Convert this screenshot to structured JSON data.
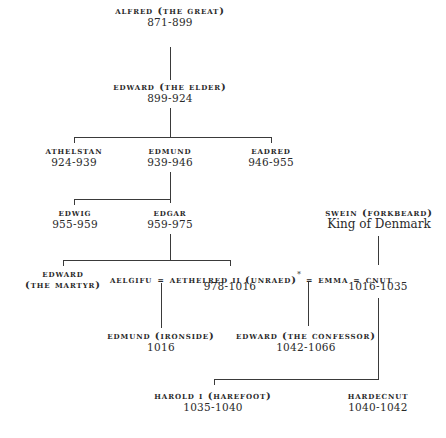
{
  "nodes": {
    "alfred": {
      "name": "Alfred (The Great)",
      "dates": "871-899"
    },
    "edward_elder": {
      "name": "Edward (The Elder)",
      "dates": "899-924"
    },
    "athelstan": {
      "name": "Athelstan",
      "dates": "924-939"
    },
    "edmund": {
      "name": "Edmund",
      "dates": "939-946"
    },
    "eadred": {
      "name": "Eadred",
      "dates": "946-955"
    },
    "edwig": {
      "name": "Edwig",
      "dates": "955-959"
    },
    "edgar": {
      "name": "Edgar",
      "dates": "959-975"
    },
    "swein": {
      "name": "Swein (Forkbeard)",
      "subtitle": "King of Denmark"
    },
    "edward_martyr": {
      "name_line1": "Edward",
      "name_line2": "(The Martyr)"
    },
    "marriage_line": {
      "aelgifu": "Aelgifu",
      "eq1": "=",
      "aethelred": "Aethelred II (Unraed)",
      "star": "*",
      "eq2": "=",
      "emma": "Emma",
      "eq3": "=",
      "cnut": "Cnut"
    },
    "aethelred_dates": "978-1016",
    "cnut_dates": "1016-1035",
    "edmund_ironside": {
      "name": "Edmund (Ironside)",
      "dates": "1016"
    },
    "edward_confessor": {
      "name": "Edward (The Confessor)",
      "dates": "1042-1066"
    },
    "harold": {
      "name": "Harold I (Harefoot)",
      "dates": "1035-1040"
    },
    "hardecnut": {
      "name": "Hardecnut",
      "dates": "1040-1042"
    }
  }
}
